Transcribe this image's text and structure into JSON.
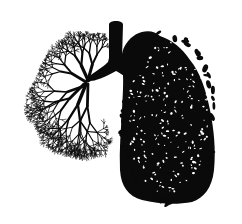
{
  "image": {
    "subject": "Lungs illustration",
    "description": "Black silhouette of human lungs: left lung drawn as a bare branching tree, right lung drawn as a dense leafy canopy, joined by a trachea at the top.",
    "background_color": "#ffffff",
    "ink_color": "#0a0a0a",
    "parts": {
      "trachea": {
        "label": "trachea",
        "x": 108,
        "y": 22,
        "width": 16,
        "height": 48
      },
      "left_lung": {
        "label": "left lung (bare branches)",
        "bbox": [
          20,
          33,
          105,
          198
        ]
      },
      "right_lung": {
        "label": "right lung (leaves)",
        "bbox": [
          119,
          30,
          216,
          203
        ]
      }
    }
  }
}
